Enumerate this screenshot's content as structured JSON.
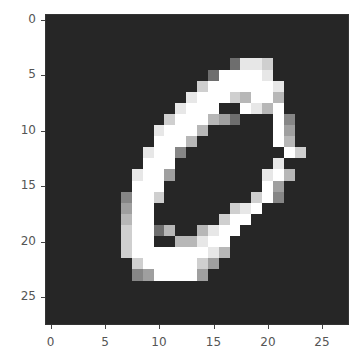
{
  "chart_data": {
    "type": "heatmap",
    "title": "",
    "xlabel": "",
    "ylabel": "",
    "colormap": "gray",
    "xlim": [
      -0.5,
      27.5
    ],
    "ylim": [
      27.5,
      -0.5
    ],
    "x_ticks": [
      0,
      5,
      10,
      15,
      20,
      25
    ],
    "y_ticks": [
      0,
      5,
      10,
      15,
      20,
      25
    ],
    "grid": false,
    "rows": [
      "............................",
      "............................",
      "............................",
      "............................",
      ".................3887........",
      "...............399998........",
      "..............79999998.......",
      ".............899976996.......",
      "............8999..9869.......",
      "...........7999653...94......",
      "..........89996......95......",
      "..........9996.......96......",
      ".........8994.........97.....",
      ".........999.........8.......",
      "........8995........896......",
      "........999.........95.......",
      ".......4997........794.......",
      ".......599.......789.........",
      ".......699......799..........",
      ".......79936..6899...........",
      ".......799..66899............",
      ".......7999999986............",
      "........79999975.............",
      "........4599995..............",
      "............................",
      "............................",
      "............................",
      "............................"
    ]
  },
  "axes": {
    "y_labels": [
      "0",
      "5",
      "10",
      "15",
      "20",
      "25"
    ],
    "x_labels": [
      "0",
      "5",
      "10",
      "15",
      "20",
      "25"
    ]
  }
}
